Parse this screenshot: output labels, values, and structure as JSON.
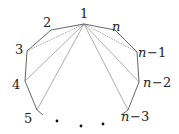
{
  "diagram": {
    "vertices": [
      {
        "id": "1",
        "label": "1",
        "x": 84,
        "y": 24
      },
      {
        "id": "2",
        "label": "2",
        "x": 51,
        "y": 30
      },
      {
        "id": "3",
        "label": "3",
        "x": 27,
        "y": 51
      },
      {
        "id": "4",
        "label": "4",
        "x": 25,
        "y": 81
      },
      {
        "id": "5",
        "label": "5",
        "x": 37,
        "y": 110
      },
      {
        "id": "n",
        "label": "n",
        "x": 115,
        "y": 30
      },
      {
        "id": "n-1",
        "label": "n−1",
        "x": 137,
        "y": 52
      },
      {
        "id": "n-2",
        "label": "n−2",
        "x": 139,
        "y": 82
      },
      {
        "id": "n-3",
        "label": "n−3",
        "x": 128,
        "y": 110
      }
    ],
    "labels": {
      "v1": "1",
      "v2": "2",
      "v3": "3",
      "v4": "4",
      "v5": "5",
      "vn": "n",
      "vn1_n": "n",
      "vn1_suffix": "−1",
      "vn2_n": "n",
      "vn2_suffix": "−2",
      "vn3_n": "n",
      "vn3_suffix": "−3"
    },
    "ellipsis": "• • •",
    "edges": [
      [
        "1",
        "2"
      ],
      [
        "2",
        "3"
      ],
      [
        "3",
        "4"
      ],
      [
        "4",
        "5"
      ],
      [
        "1",
        "n"
      ],
      [
        "n",
        "n-1"
      ],
      [
        "n-1",
        "n-2"
      ],
      [
        "n-2",
        "n-3"
      ]
    ],
    "diagonals_from_1": [
      "3",
      "4",
      "5",
      "n-1",
      "n-2",
      "n-3"
    ]
  }
}
